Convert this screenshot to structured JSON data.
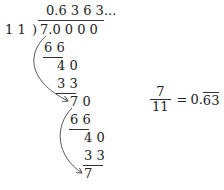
{
  "division": {
    "divisor": "1 1",
    "bracket": ")",
    "dividend": "7.0 0 0 0",
    "quotient": "0.6 3 6 3...",
    "steps": [
      {
        "value": "6 6",
        "underline": true
      },
      {
        "value": "4 0",
        "underline": false
      },
      {
        "value": "3 3",
        "underline": true
      },
      {
        "value": "7 0",
        "underline": false
      },
      {
        "value": "6 6",
        "underline": true
      },
      {
        "value": "4 0",
        "underline": false
      },
      {
        "value": "3 3",
        "underline": true
      },
      {
        "value": "7",
        "underline": false
      }
    ],
    "arrows": [
      {
        "from": "dividend-7",
        "to": "remainder-70",
        "label": "repeat-arrow-1"
      },
      {
        "from": "remainder-70",
        "to": "remainder-7",
        "label": "repeat-arrow-2"
      }
    ]
  },
  "result": {
    "numerator": "7",
    "denominator": "11",
    "equals": "=",
    "whole": "0.",
    "repeating": "63"
  }
}
